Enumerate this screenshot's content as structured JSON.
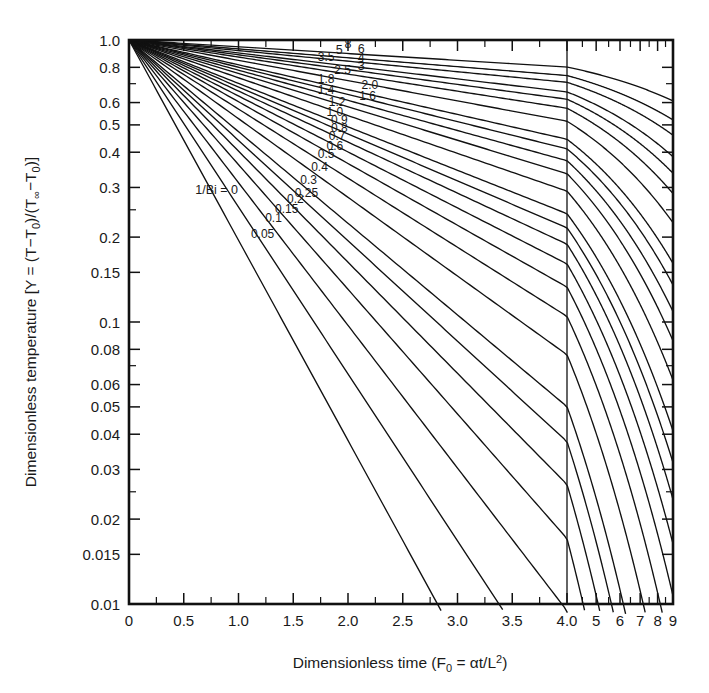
{
  "figure": {
    "kind": "heisler-chart",
    "background": "#ffffff",
    "ink": "#1a1a1a"
  },
  "chart_data": {
    "type": "line",
    "title": "",
    "xlabel": "Dimensionless time (F₀ = αt/L²)",
    "ylabel": "Dimensionless temperature [Y = (T−T₀)/(T∞−T₀)]",
    "ylabel_parts": {
      "lead": "Dimensionless temperature",
      "bracket_open": "[",
      "y_sym": "Y",
      "eq": "=",
      "num_open": "(",
      "T": "T",
      "minus": "−",
      "T0": "T",
      "sub0": "0",
      "num_close": ")",
      "slash": "/",
      "den_open": "(",
      "Tinf": "T",
      "subinf": "∞",
      "T0b": "T",
      "sub0b": "0",
      "den_close": ")",
      "bracket_close": "]"
    },
    "xlabel_parts": {
      "lead": "Dimensionless time",
      "paren_open": "(",
      "F": "F",
      "Fsub": "0",
      "eq": "=",
      "alpha": "α",
      "t": "t",
      "slash": "/",
      "L": "L",
      "Lsup": "2",
      "paren_close": ")"
    },
    "yscale": "log",
    "ylim": [
      0.01,
      1.0
    ],
    "y_ticks": [
      {
        "value": 1.0,
        "label": "1.0",
        "major": true
      },
      {
        "value": 0.8,
        "label": "0.8",
        "major": true
      },
      {
        "value": 0.7,
        "label": "",
        "major": false
      },
      {
        "value": 0.6,
        "label": "0.6",
        "major": true
      },
      {
        "value": 0.5,
        "label": "0.5",
        "major": true
      },
      {
        "value": 0.4,
        "label": "0.4",
        "major": true
      },
      {
        "value": 0.3,
        "label": "0.3",
        "major": true
      },
      {
        "value": 0.25,
        "label": "",
        "major": false
      },
      {
        "value": 0.2,
        "label": "0.2",
        "major": true
      },
      {
        "value": 0.15,
        "label": "0.15",
        "major": true
      },
      {
        "value": 0.1,
        "label": "0.1",
        "major": true
      },
      {
        "value": 0.08,
        "label": "0.08",
        "major": true
      },
      {
        "value": 0.07,
        "label": "",
        "major": false
      },
      {
        "value": 0.06,
        "label": "0.06",
        "major": true
      },
      {
        "value": 0.05,
        "label": "0.05",
        "major": true
      },
      {
        "value": 0.04,
        "label": "0.04",
        "major": true
      },
      {
        "value": 0.03,
        "label": "0.03",
        "major": true
      },
      {
        "value": 0.025,
        "label": "",
        "major": false
      },
      {
        "value": 0.02,
        "label": "0.02",
        "major": true
      },
      {
        "value": 0.015,
        "label": "0.015",
        "major": true
      },
      {
        "value": 0.01,
        "label": "0.01",
        "major": true
      }
    ],
    "xscale": "linear-then-log",
    "xlim_linear": [
      0,
      4.0
    ],
    "xlim_log": [
      4.0,
      9.0
    ],
    "x_break": 4.0,
    "x_ticks": [
      {
        "value": 0,
        "label": "0",
        "major": true
      },
      {
        "value": 0.25,
        "label": "",
        "major": false
      },
      {
        "value": 0.5,
        "label": "0.5",
        "major": true
      },
      {
        "value": 0.75,
        "label": "",
        "major": false
      },
      {
        "value": 1.0,
        "label": "1.0",
        "major": true
      },
      {
        "value": 1.25,
        "label": "",
        "major": false
      },
      {
        "value": 1.5,
        "label": "1.5",
        "major": true
      },
      {
        "value": 1.75,
        "label": "",
        "major": false
      },
      {
        "value": 2.0,
        "label": "2.0",
        "major": true
      },
      {
        "value": 2.25,
        "label": "",
        "major": false
      },
      {
        "value": 2.5,
        "label": "2.5",
        "major": true
      },
      {
        "value": 2.75,
        "label": "",
        "major": false
      },
      {
        "value": 3.0,
        "label": "3.0",
        "major": true
      },
      {
        "value": 3.25,
        "label": "",
        "major": false
      },
      {
        "value": 3.5,
        "label": "3.5",
        "major": true
      },
      {
        "value": 3.75,
        "label": "",
        "major": false
      },
      {
        "value": 4.0,
        "label": "4.0",
        "major": true
      }
    ],
    "x_ticks_log": [
      {
        "value": 4.5,
        "label": "",
        "major": false
      },
      {
        "value": 5.0,
        "label": "5",
        "major": true
      },
      {
        "value": 5.5,
        "label": "",
        "major": false
      },
      {
        "value": 6.0,
        "label": "6",
        "major": true
      },
      {
        "value": 6.5,
        "label": "",
        "major": false
      },
      {
        "value": 7.0,
        "label": "7",
        "major": true
      },
      {
        "value": 7.5,
        "label": "",
        "major": false
      },
      {
        "value": 8.0,
        "label": "8",
        "major": true
      },
      {
        "value": 8.5,
        "label": "",
        "major": false
      },
      {
        "value": 9.0,
        "label": "9",
        "major": true
      }
    ],
    "parameter_name": "1/Bi",
    "legend_note": "1/Bi = 0",
    "series": [
      {
        "name": "8",
        "label": "8",
        "y0": 1.0,
        "slope": 0.024,
        "label_x": 2.0,
        "label_dy": -6
      },
      {
        "name": "6",
        "label": "6",
        "y0": 1.0,
        "slope": 0.0315,
        "label_x": 2.12,
        "label_dy": -6
      },
      {
        "name": "5",
        "label": "5",
        "y0": 1.0,
        "slope": 0.0375,
        "label_x": 1.92,
        "label_dy": -6
      },
      {
        "name": "4",
        "label": "4",
        "y0": 1.0,
        "slope": 0.046,
        "label_x": 2.12,
        "label_dy": -6
      },
      {
        "name": "3.5",
        "label": "3.5",
        "y0": 1.0,
        "slope": 0.0525,
        "label_x": 1.8,
        "label_dy": -6
      },
      {
        "name": "3",
        "label": "3",
        "y0": 1.0,
        "slope": 0.0605,
        "label_x": 2.12,
        "label_dy": -6
      },
      {
        "name": "2.5",
        "label": "2.5",
        "y0": 1.0,
        "slope": 0.072,
        "label_x": 1.95,
        "label_dy": -6
      },
      {
        "name": "2.0",
        "label": "2.0",
        "y0": 1.0,
        "slope": 0.088,
        "label_x": 2.2,
        "label_dy": -6
      },
      {
        "name": "1.8",
        "label": "1.8",
        "y0": 1.0,
        "slope": 0.0965,
        "label_x": 1.8,
        "label_dy": -6
      },
      {
        "name": "1.6",
        "label": "1.6",
        "y0": 1.0,
        "slope": 0.107,
        "label_x": 2.18,
        "label_dy": -6
      },
      {
        "name": "1.4",
        "label": "1.4",
        "y0": 1.0,
        "slope": 0.1185,
        "label_x": 1.8,
        "label_dy": -6
      },
      {
        "name": "1.2",
        "label": "1.2",
        "y0": 1.0,
        "slope": 0.134,
        "label_x": 1.9,
        "label_dy": -6
      },
      {
        "name": "1.0",
        "label": "1.0",
        "y0": 1.0,
        "slope": 0.154,
        "label_x": 1.88,
        "label_dy": -6
      },
      {
        "name": "0.9",
        "label": "0.9",
        "y0": 1.0,
        "slope": 0.1665,
        "label_x": 1.92,
        "label_dy": -6
      },
      {
        "name": "0.8",
        "label": "0.8",
        "y0": 1.0,
        "slope": 0.181,
        "label_x": 1.92,
        "label_dy": -6
      },
      {
        "name": "0.7",
        "label": "0.7",
        "y0": 1.0,
        "slope": 0.1985,
        "label_x": 1.9,
        "label_dy": -6
      },
      {
        "name": "0.6",
        "label": "0.6",
        "y0": 1.0,
        "slope": 0.219,
        "label_x": 1.88,
        "label_dy": -6
      },
      {
        "name": "0.5",
        "label": "0.5",
        "y0": 1.0,
        "slope": 0.245,
        "label_x": 1.8,
        "label_dy": -6
      },
      {
        "name": "0.4",
        "label": "0.4",
        "y0": 1.0,
        "slope": 0.279,
        "label_x": 1.74,
        "label_dy": -6
      },
      {
        "name": "0.3",
        "label": "0.3",
        "y0": 1.0,
        "slope": 0.325,
        "label_x": 1.64,
        "label_dy": -6
      },
      {
        "name": "0.25",
        "label": "0.25",
        "y0": 1.0,
        "slope": 0.356,
        "label_x": 1.62,
        "label_dy": -6
      },
      {
        "name": "0.2",
        "label": "0.2",
        "y0": 1.0,
        "slope": 0.394,
        "label_x": 1.52,
        "label_dy": -6
      },
      {
        "name": "0.15",
        "label": "0.15",
        "y0": 1.0,
        "slope": 0.442,
        "label_x": 1.44,
        "label_dy": -6
      },
      {
        "name": "0.1",
        "label": "0.1",
        "y0": 1.0,
        "slope": 0.506,
        "label_x": 1.32,
        "label_dy": -6
      },
      {
        "name": "0.05",
        "label": "0.05",
        "y0": 1.0,
        "slope": 0.592,
        "label_x": 1.22,
        "label_dy": -6
      },
      {
        "name": "0",
        "label": "1/Bi = 0",
        "y0": 1.0,
        "slope": 0.71,
        "label_x": 0.8,
        "label_dy": -6
      }
    ]
  }
}
